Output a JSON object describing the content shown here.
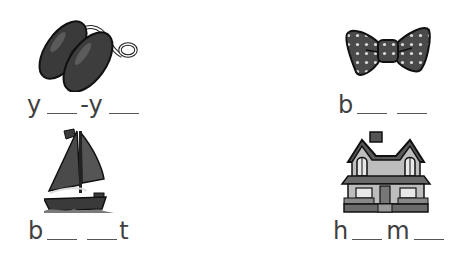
{
  "worksheet": {
    "items": [
      {
        "picture": "yo-yo",
        "parts": [
          {
            "type": "letter",
            "text": "y"
          },
          {
            "type": "blank"
          },
          {
            "type": "letter",
            "text": "-y"
          },
          {
            "type": "blank"
          }
        ]
      },
      {
        "picture": "bow",
        "parts": [
          {
            "type": "letter",
            "text": "b"
          },
          {
            "type": "blank"
          },
          {
            "type": "blank"
          }
        ]
      },
      {
        "picture": "boat",
        "parts": [
          {
            "type": "letter",
            "text": "b"
          },
          {
            "type": "blank"
          },
          {
            "type": "blank"
          },
          {
            "type": "letter",
            "text": "t"
          }
        ]
      },
      {
        "picture": "home",
        "parts": [
          {
            "type": "letter",
            "text": "h"
          },
          {
            "type": "blank"
          },
          {
            "type": "letter",
            "text": "m"
          },
          {
            "type": "blank"
          }
        ]
      }
    ],
    "letters": {
      "yoyo_1": "y",
      "yoyo_2": "-y",
      "bow_1": "b",
      "boat_1": "b",
      "boat_2": "t",
      "home_1": "h",
      "home_2": "m"
    }
  },
  "colors": {
    "ink": "#3f3f3f",
    "dark_fill": "#3d3d3d",
    "mid_fill": "#6e6e6e",
    "light_fill": "#c8c8c8",
    "background": "#ffffff"
  }
}
